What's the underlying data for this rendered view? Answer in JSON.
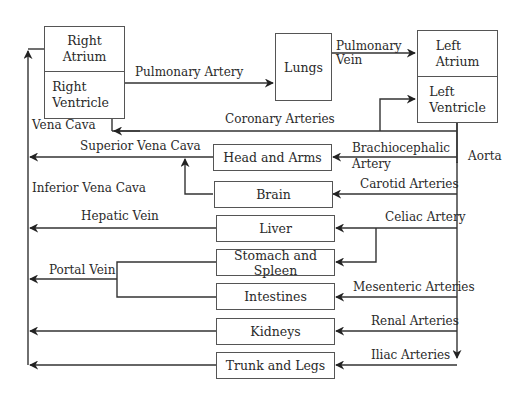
{
  "diagram": {
    "heart": {
      "right_atrium": "Right\nAtrium",
      "right_ventricle": "Right\nVentricle",
      "left_atrium": "Left\nAtrium",
      "left_ventricle": "Left\nVentricle",
      "right_atrium_l1": "Right",
      "right_atrium_l2": "Atrium",
      "right_ventricle_l1": "Right",
      "right_ventricle_l2": "Ventricle",
      "left_atrium_l1": "Left",
      "left_atrium_l2": "Atrium",
      "left_ventricle_l1": "Left",
      "left_ventricle_l2": "Ventricle"
    },
    "lungs": "Lungs",
    "organs": [
      {
        "name": "Head and Arms",
        "artery": "Brachiocephalic Artery"
      },
      {
        "name": "Brain",
        "artery": "Carotid Arteries"
      },
      {
        "name": "Liver",
        "artery": "Celiac Artery"
      },
      {
        "name": "Stomach and Spleen",
        "artery": "Celiac Artery"
      },
      {
        "name": "Intestines",
        "artery": "Mesenteric Arteries"
      },
      {
        "name": "Kidneys",
        "artery": "Renal Arteries"
      },
      {
        "name": "Trunk and Legs",
        "artery": "Iliac Arteries"
      }
    ],
    "vessel_labels": {
      "pulmonary_artery": "Pulmonary Artery",
      "pulmonary_vein_l1": "Pulmonary",
      "pulmonary_vein_l2": "Vein",
      "coronary_arteries": "Coronary Arteries",
      "vena_cava": "Vena Cava",
      "superior_vena_cava": "Superior Vena Cava",
      "inferior_vena_cava": "Inferior Vena Cava",
      "hepatic_vein": "Hepatic Vein",
      "portal_vein": "Portal Vein",
      "aorta": "Aorta",
      "brachiocephalic_l1": "Brachiocephalic",
      "brachiocephalic_l2": "Artery",
      "carotid_arteries": "Carotid Arteries",
      "celiac_artery": "Celiac Artery",
      "mesenteric_arteries": "Mesenteric Arteries",
      "renal_arteries": "Renal Arteries",
      "iliac_arteries": "Iliac Arteries"
    },
    "colors": {
      "line": "#333333",
      "box_border": "#555555",
      "text": "#2a2a2a"
    }
  }
}
